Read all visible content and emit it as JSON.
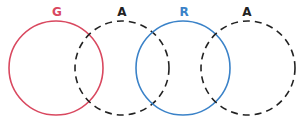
{
  "diagram": {
    "type": "venn",
    "pairs": [
      {
        "solid": {
          "label": "G",
          "color": "#d9485f"
        },
        "dashed": {
          "label": "A",
          "color": "#222222"
        }
      },
      {
        "solid": {
          "label": "R",
          "color": "#3a82c8"
        },
        "dashed": {
          "label": "A",
          "color": "#222222"
        }
      }
    ]
  }
}
